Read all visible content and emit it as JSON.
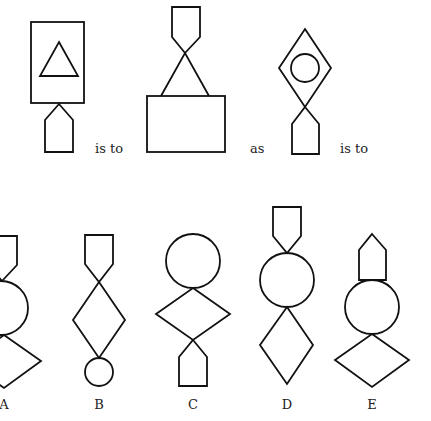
{
  "puzzle": {
    "type": "figural-analogy",
    "connectors": {
      "first": "is to",
      "middle": "as",
      "last": "is to"
    },
    "stem": [
      {
        "id": "fig1",
        "description": "rectangle containing triangle, with pentagon (point up) below touching rectangle"
      },
      {
        "id": "fig2",
        "description": "inverted pentagon on top, point touching apex of open triangle, standing on rectangle"
      },
      {
        "id": "fig3",
        "description": "diamond containing circle, with pentagon (point up) below touching diamond"
      }
    ],
    "options": [
      {
        "label": "A",
        "description": "inverted pentagon, circle, diamond stacked"
      },
      {
        "label": "B",
        "description": "inverted pentagon, diamond, small circle stacked"
      },
      {
        "label": "C",
        "description": "circle, diamond, pentagon (point up) stacked"
      },
      {
        "label": "D",
        "description": "inverted pentagon, circle, diamond stacked"
      },
      {
        "label": "E",
        "description": "pentagon (point up), circle, wide diamond stacked"
      }
    ]
  },
  "colors": {
    "stroke": "#111111",
    "background": "#ffffff",
    "text": "#222222"
  }
}
